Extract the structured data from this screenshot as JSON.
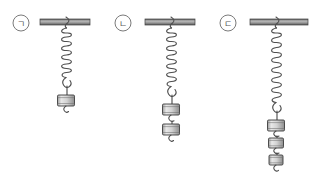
{
  "figure": {
    "background_color": "#ffffff",
    "width": 318,
    "height": 173,
    "bar_color": "#8c8c8c",
    "bar_edge_color": "#4a4a4a",
    "spring_color": "#555555",
    "weight_fill": "#d8d8d8",
    "weight_edge": "#3c3c3c",
    "label_color": "#5a5a5a"
  },
  "systems": [
    {
      "id": "system-a",
      "label": "ㄱ",
      "label_cx": 21,
      "label_cy": 23,
      "label_r": 8,
      "bar_x": 40,
      "bar_y": 19,
      "bar_width": 50,
      "bar_height": 6,
      "anchor_x": 66,
      "spring_top": 25,
      "spring_bottom": 79,
      "spring_coils": 11,
      "spring_radius": 7,
      "spring_length": 54,
      "weight_count": 1,
      "weights": [
        {
          "x": 66,
          "y": 95,
          "w": 17,
          "h": 11
        }
      ]
    },
    {
      "id": "system-b",
      "label": "ㄴ",
      "label_cx": 123,
      "label_cy": 23,
      "label_r": 8,
      "bar_x": 145,
      "bar_y": 19,
      "bar_width": 50,
      "bar_height": 6,
      "anchor_x": 171,
      "spring_top": 25,
      "spring_bottom": 88,
      "spring_coils": 13,
      "spring_radius": 7,
      "spring_length": 63,
      "weight_count": 2,
      "weights": [
        {
          "x": 171,
          "y": 104,
          "w": 17,
          "h": 11
        },
        {
          "x": 171,
          "y": 124,
          "w": 17,
          "h": 11
        }
      ]
    },
    {
      "id": "system-c",
      "label": "ㄷ",
      "label_cx": 228,
      "label_cy": 23,
      "label_r": 8,
      "bar_x": 250,
      "bar_y": 19,
      "bar_width": 58,
      "bar_height": 6,
      "anchor_x": 276,
      "spring_top": 25,
      "spring_bottom": 104,
      "spring_coils": 15,
      "spring_radius": 7,
      "spring_length": 79,
      "weight_count": 3,
      "weights": [
        {
          "x": 276,
          "y": 120,
          "w": 17,
          "h": 11
        },
        {
          "x": 276,
          "y": 138,
          "w": 15,
          "h": 10
        },
        {
          "x": 276,
          "y": 155,
          "w": 14,
          "h": 10
        }
      ]
    }
  ]
}
